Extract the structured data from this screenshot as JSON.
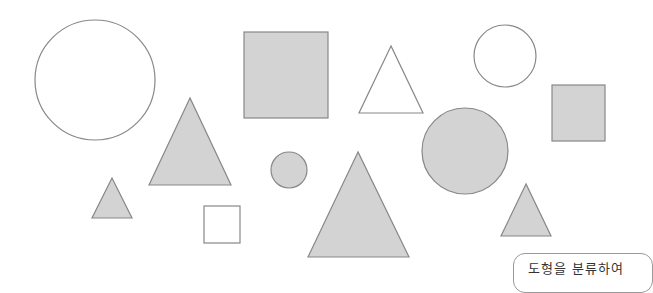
{
  "colors": {
    "gray_fill": "#d3d3d3",
    "white_fill": "#ffffff",
    "stroke": "#888888"
  },
  "shapes": [
    {
      "type": "circle",
      "fill": "white",
      "cx": 95,
      "cy": 80,
      "r": 60
    },
    {
      "type": "triangle",
      "fill": "gray",
      "points": "190,98 149,185 231,185"
    },
    {
      "type": "square",
      "fill": "gray",
      "x": 244,
      "y": 32,
      "w": 84,
      "h": 86
    },
    {
      "type": "triangle",
      "fill": "white",
      "points": "391,46 359,113 423,113"
    },
    {
      "type": "circle",
      "fill": "white",
      "cx": 505,
      "cy": 56,
      "r": 31
    },
    {
      "type": "square",
      "fill": "gray",
      "x": 552,
      "y": 85,
      "w": 53,
      "h": 56
    },
    {
      "type": "circle",
      "fill": "gray",
      "cx": 465,
      "cy": 151,
      "r": 43
    },
    {
      "type": "triangle",
      "fill": "gray",
      "points": "112,178 92,218 132,218"
    },
    {
      "type": "square",
      "fill": "white",
      "x": 204,
      "y": 206,
      "w": 36,
      "h": 37
    },
    {
      "type": "circle",
      "fill": "gray",
      "cx": 289,
      "cy": 170,
      "r": 18
    },
    {
      "type": "triangle",
      "fill": "gray",
      "points": "358,152 308,257 409,257"
    },
    {
      "type": "triangle",
      "fill": "gray",
      "points": "526,184 501,236 551,236"
    }
  ],
  "label": {
    "text": "도형을 분류하여"
  }
}
